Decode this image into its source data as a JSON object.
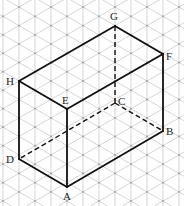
{
  "diagram": {
    "type": "isometric-cuboid",
    "grid": {
      "type": "isometric-triangular",
      "line_color": "#b9b9b9",
      "dot_color": "#9a9a9a",
      "column_spacing": 16
    },
    "edge_color": "#111111",
    "vertices": {
      "A": {
        "label": "A",
        "x": 67,
        "y": 187
      },
      "B": {
        "label": "B",
        "x": 163,
        "y": 131
      },
      "C": {
        "label": "C",
        "x": 115,
        "y": 103
      },
      "D": {
        "label": "D",
        "x": 19,
        "y": 159
      },
      "E": {
        "label": "E",
        "x": 67,
        "y": 109
      },
      "F": {
        "label": "F",
        "x": 163,
        "y": 54
      },
      "G": {
        "label": "G",
        "x": 115,
        "y": 26
      },
      "H": {
        "label": "H",
        "x": 19,
        "y": 81
      }
    },
    "solid_edges": [
      "AB",
      "AD",
      "AE",
      "BF",
      "EF",
      "EH",
      "DH",
      "HG",
      "GF"
    ],
    "hidden_edges": [
      "CD",
      "CB",
      "CG"
    ]
  }
}
